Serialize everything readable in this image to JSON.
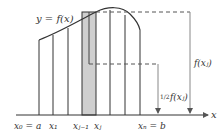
{
  "diagram": {
    "curve_label": "y = f(x)",
    "axis_label": "x",
    "tick_labels": {
      "x0": "x₀ = a",
      "x1": "x₁",
      "xjm1": "xⱼ₋₁",
      "xj": "xⱼ",
      "xN": "xₙ = b"
    },
    "annotations": {
      "full_height": "f(xⱼ)",
      "half_height_frac": "1/2",
      "half_height": "f(xⱼ)"
    },
    "colors": {
      "line": "#333333",
      "shade": "#c8c8c8",
      "dashed": "#555555",
      "arrow": "#777777"
    }
  }
}
